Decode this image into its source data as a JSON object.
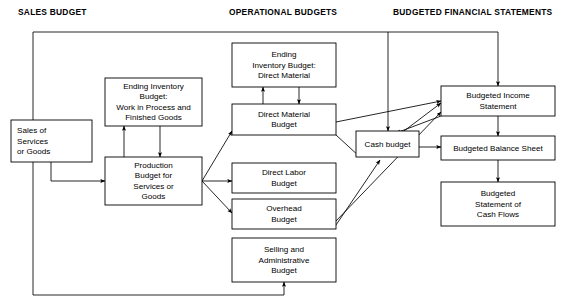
{
  "canvas": {
    "width": 566,
    "height": 308,
    "background": "#ffffff",
    "line_color": "#000000"
  },
  "headers": [
    {
      "id": "sales-budget-header",
      "label": "SALES BUDGET",
      "x": 18,
      "y": 15
    },
    {
      "id": "operational-budgets-header",
      "label": "OPERATIONAL BUDGETS",
      "x": 229,
      "y": 15
    },
    {
      "id": "budgeted-financial-statements-header",
      "label": "BUDGETED FINANCIAL STATEMENTS",
      "x": 393,
      "y": 15
    }
  ],
  "nodes": [
    {
      "id": "sales-of-services-or-goods",
      "name": "node-sales-of-services-or-goods",
      "lines": [
        "Sales of",
        "Services",
        "or Goods"
      ],
      "x": 11,
      "y": 120,
      "w": 81,
      "h": 42,
      "align": "left"
    },
    {
      "id": "ending-inventory-budget-wip-fg",
      "name": "node-ending-inventory-budget-work-in-process-finished-goods",
      "lines": [
        "Ending Inventory",
        "Budget:",
        "Work in Process and",
        "Finished Goods"
      ],
      "x": 105,
      "y": 78,
      "w": 97,
      "h": 48,
      "align": "center"
    },
    {
      "id": "production-budget",
      "name": "node-production-budget-for-services-or-goods",
      "lines": [
        "Production",
        "Budget for",
        "Services or",
        "Goods"
      ],
      "x": 105,
      "y": 157,
      "w": 97,
      "h": 48,
      "align": "center"
    },
    {
      "id": "ending-inventory-budget-direct-material",
      "name": "node-ending-inventory-budget-direct-material",
      "lines": [
        "Ending",
        "Inventory Budget:",
        "Direct Material"
      ],
      "x": 232,
      "y": 43,
      "w": 104,
      "h": 44,
      "align": "center"
    },
    {
      "id": "direct-material-budget",
      "name": "node-direct-material-budget",
      "lines": [
        "Direct Material",
        "Budget"
      ],
      "x": 232,
      "y": 104,
      "w": 104,
      "h": 31,
      "align": "center"
    },
    {
      "id": "direct-labor-budget",
      "name": "node-direct-labor-budget",
      "lines": [
        "Direct Labor",
        "Budget"
      ],
      "x": 232,
      "y": 163,
      "w": 104,
      "h": 30,
      "align": "center"
    },
    {
      "id": "overhead-budget",
      "name": "node-overhead-budget",
      "lines": [
        "Overhead",
        "Budget"
      ],
      "x": 232,
      "y": 199,
      "w": 104,
      "h": 30,
      "align": "center"
    },
    {
      "id": "selling-and-administrative-budget",
      "name": "node-selling-and-administrative-budget",
      "lines": [
        "Selling and",
        "Administrative",
        "Budget"
      ],
      "x": 232,
      "y": 238,
      "w": 104,
      "h": 44,
      "align": "center"
    },
    {
      "id": "cash-budget",
      "name": "node-cash-budget",
      "lines": [
        "Cash budget"
      ],
      "x": 356,
      "y": 131,
      "w": 63,
      "h": 26,
      "align": "center"
    },
    {
      "id": "budgeted-income-statement",
      "name": "node-budgeted-income-statement",
      "lines": [
        "Budgeted Income",
        "Statement"
      ],
      "x": 441,
      "y": 86,
      "w": 114,
      "h": 30,
      "align": "center"
    },
    {
      "id": "budgeted-balance-sheet",
      "name": "node-budgeted-balance-sheet",
      "lines": [
        "Budgeted Balance Sheet"
      ],
      "x": 441,
      "y": 136,
      "w": 114,
      "h": 24,
      "align": "center"
    },
    {
      "id": "budgeted-statement-of-cash-flows",
      "name": "node-budgeted-statement-of-cash-flows",
      "lines": [
        "Budgeted",
        "Statement of",
        "Cash Flows"
      ],
      "x": 441,
      "y": 182,
      "w": 114,
      "h": 44,
      "align": "center"
    }
  ],
  "connectors": [
    {
      "id": "top-rail",
      "name": "connector-top-rail-sales-to-financial-statements",
      "points": "33,120 33,32 498,32",
      "arrow": "none"
    },
    {
      "id": "top-rail-drop-cash-budget",
      "name": "connector-top-rail-to-cash-budget",
      "points": "388,32 388,131",
      "arrow": "end"
    },
    {
      "id": "top-rail-drop-income-statement",
      "name": "connector-top-rail-to-budgeted-income-statement",
      "points": "498,32 498,86",
      "arrow": "end"
    },
    {
      "id": "sales-to-production",
      "name": "connector-sales-to-production-budget",
      "points": "51,162 51,181 105,181",
      "arrow": "end"
    },
    {
      "id": "bottom-rail-sales-to-selling-admin",
      "name": "connector-sales-to-selling-and-administrative-budget",
      "points": "33,162 33,295 284,295 284,282",
      "arrow": "end"
    },
    {
      "id": "production-to-ending-inv-wip",
      "name": "connector-production-budget-to-ending-inventory-wip",
      "points": "124,157 124,126",
      "arrow": "end"
    },
    {
      "id": "ending-inv-wip-to-production",
      "name": "connector-ending-inventory-wip-to-production-budget",
      "points": "160,126 160,157",
      "arrow": "end"
    },
    {
      "id": "direct-material-to-ending-inv-dm",
      "name": "connector-direct-material-budget-to-ending-inventory-direct-material",
      "points": "263,104 263,87",
      "arrow": "end"
    },
    {
      "id": "ending-inv-dm-to-direct-material",
      "name": "connector-ending-inventory-direct-material-to-direct-material-budget",
      "points": "299,87 299,104",
      "arrow": "end"
    },
    {
      "id": "production-to-direct-material",
      "name": "connector-production-budget-to-direct-material-budget",
      "points": "202,181 232,131",
      "arrow": "end"
    },
    {
      "id": "production-to-direct-labor",
      "name": "connector-production-budget-to-direct-labor-budget",
      "points": "202,181 232,181",
      "arrow": "end"
    },
    {
      "id": "production-to-overhead",
      "name": "connector-production-budget-to-overhead-budget",
      "points": "202,181 232,213",
      "arrow": "end"
    },
    {
      "id": "direct-material-to-income-statement",
      "name": "connector-direct-material-budget-to-budgeted-income-statement",
      "points": "336,122 441,101",
      "arrow": "end"
    },
    {
      "id": "direct-material-to-cash-budget",
      "name": "connector-direct-material-budget-to-cash-budget",
      "points": "336,135 360,157",
      "arrow": "end"
    },
    {
      "id": "overhead-to-income-statement",
      "name": "connector-overhead-budget-to-budgeted-income-statement",
      "points": "336,221 441,112",
      "arrow": "end"
    },
    {
      "id": "overhead-to-cash-budget",
      "name": "connector-overhead-budget-to-cash-budget",
      "points": "336,225 380,160",
      "arrow": "end"
    },
    {
      "id": "cash-budget-to-income-statement",
      "name": "connector-cash-budget-to-budgeted-income-statement",
      "points": "404,131 441,103",
      "arrow": "end"
    },
    {
      "id": "income-statement-to-cash-budget",
      "name": "connector-budgeted-income-statement-to-cash-budget",
      "points": "441,116 396,133",
      "arrow": "end"
    },
    {
      "id": "cash-budget-to-balance-sheet",
      "name": "connector-cash-budget-to-budgeted-balance-sheet",
      "points": "419,147 441,147",
      "arrow": "end"
    },
    {
      "id": "income-statement-to-balance-sheet",
      "name": "connector-budgeted-income-statement-to-budgeted-balance-sheet",
      "points": "498,116 498,136",
      "arrow": "end"
    },
    {
      "id": "balance-sheet-to-cash-flows",
      "name": "connector-budgeted-balance-sheet-to-budgeted-statement-of-cash-flows",
      "points": "498,160 498,182",
      "arrow": "end"
    }
  ]
}
